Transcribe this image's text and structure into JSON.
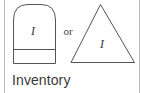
{
  "diagram": {
    "shapes": [
      {
        "id": "arch",
        "type": "arch-with-divider",
        "label": "I"
      },
      {
        "id": "triangle",
        "type": "triangle",
        "label": "I"
      }
    ],
    "connector_text": "or",
    "caption": "Inventory"
  },
  "colors": {
    "stroke": "#555555",
    "border": "#b8b8b8",
    "text": "#3a3a3a"
  }
}
